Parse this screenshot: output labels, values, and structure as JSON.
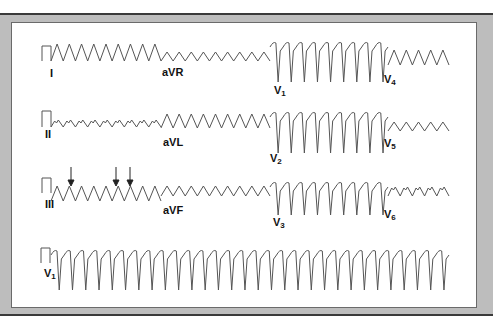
{
  "figure": {
    "colors": {
      "trace": "#555555",
      "label": "#111111",
      "frame": "#bdbdbd",
      "panel": "#ffffff"
    },
    "rows": [
      {
        "leads": [
          "I",
          "aVR",
          "V1",
          "V4"
        ]
      },
      {
        "leads": [
          "II",
          "aVL",
          "V2",
          "V5"
        ]
      },
      {
        "leads": [
          "III",
          "aVF",
          "V3",
          "V6"
        ]
      },
      {
        "leads": [
          "V1"
        ],
        "rhythm_strip": true
      }
    ],
    "labels": {
      "I": "I",
      "aVR": "aVR",
      "V1": "V",
      "V1_sub": "1",
      "V4": "V",
      "V4_sub": "4",
      "II": "II",
      "aVL": "aVL",
      "V2": "V",
      "V2_sub": "2",
      "V5": "V",
      "V5_sub": "5",
      "III": "III",
      "aVF": "aVF",
      "V3": "V",
      "V3_sub": "3",
      "V6": "V",
      "V6_sub": "6",
      "rhythm": "V",
      "rhythm_sub": "1"
    },
    "annotations": {
      "arrows": [
        {
          "lead": "III",
          "symbol": "down-arrow",
          "x": 71
        },
        {
          "lead": "III",
          "symbol": "down-arrow",
          "x": 116
        },
        {
          "lead": "III",
          "symbol": "down-arrow",
          "x": 130
        }
      ]
    },
    "calibration_pulse": "rectangular 1 mV pulse at start of each row"
  }
}
